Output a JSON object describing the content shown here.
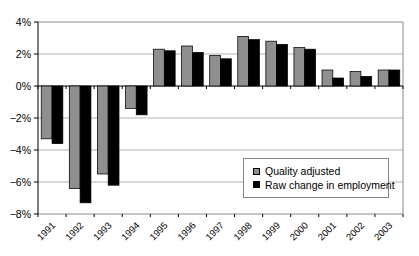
{
  "chart_data": {
    "type": "bar",
    "title": "",
    "xlabel": "",
    "ylabel": "",
    "categories": [
      "1991",
      "1992",
      "1993",
      "1994",
      "1995",
      "1996",
      "1997",
      "1998",
      "1999",
      "2000",
      "2001",
      "2002",
      "2003"
    ],
    "series": [
      {
        "name": "Quality adjusted",
        "color": "#8f8f8f",
        "values": [
          -3.3,
          -6.4,
          -5.5,
          -1.4,
          2.3,
          2.5,
          1.9,
          3.1,
          2.8,
          2.4,
          1.0,
          0.9,
          1.0
        ]
      },
      {
        "name": "Raw change in employment",
        "color": "#000000",
        "values": [
          -3.6,
          -7.3,
          -6.2,
          -1.8,
          2.2,
          2.1,
          1.7,
          2.9,
          2.6,
          2.3,
          0.5,
          0.6,
          1.0
        ]
      }
    ],
    "ylim": [
      -8,
      4
    ],
    "ytick_step": 2,
    "ytick_labels_top_to_bottom": [
      "4%",
      "2%",
      "0%",
      "−2%",
      "−4%",
      "−6%",
      "−8%"
    ],
    "grid": true,
    "legend_position": "inside-lower-right",
    "colors": {
      "gridline": "#b3b3b3",
      "plot_border": "#8a8a8a",
      "axis": "#000000",
      "background": "#ffffff"
    }
  }
}
